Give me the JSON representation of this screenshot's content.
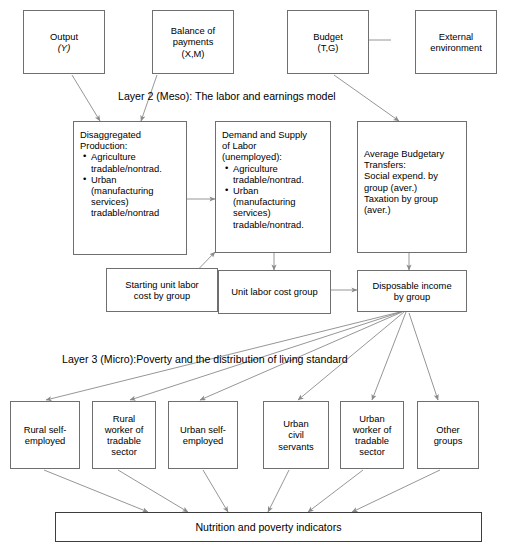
{
  "diagram": {
    "colors": {
      "box_border": "#6f6f6f",
      "arrow": "#8a8a8a",
      "text": "#000000",
      "background": "#ffffff",
      "bottom_bar_border": "#3d3d3d"
    }
  },
  "layer1": {
    "boxes": [
      {
        "id": "output",
        "line1": "Output",
        "line2": "(Y)"
      },
      {
        "id": "bop",
        "line1": "Balance of",
        "line2": "payments",
        "line3": "(X,M)"
      },
      {
        "id": "budget",
        "line1": "Budget",
        "line2": "(T,G)"
      },
      {
        "id": "external",
        "line1": "External",
        "line2": "environment"
      }
    ]
  },
  "layer2": {
    "label": "Layer 2 (Meso): The labor and earnings model",
    "production": {
      "title_line1": "Disaggregated",
      "title_line2": "Production:",
      "bullets": [
        [
          "Agriculture",
          "tradable/nontrad."
        ],
        [
          "Urban",
          "(manufacturing",
          "services)",
          "tradable/nontrad"
        ]
      ]
    },
    "labor": {
      "title_line1": "Demand and Supply",
      "title_line2": "of Labor",
      "title_line3": "(unemployed):",
      "bullets": [
        [
          "Agriculture",
          "tradable/nontrad."
        ],
        [
          "Urban",
          "(manufacturing",
          "services)",
          "tradable/nontrad."
        ]
      ]
    },
    "transfers": {
      "lines": [
        "Average Budgetary",
        "Transfers:",
        "Social expend. by",
        "group (aver.)",
        "Taxation by group",
        "(aver.)"
      ]
    },
    "row2": [
      {
        "id": "starting-unit-labor-cost",
        "line1": "Starting unit labor",
        "line2": "cost by group"
      },
      {
        "id": "unit-labor-cost-group",
        "line1": "Unit labor cost group",
        "line2": ""
      },
      {
        "id": "disposable-income",
        "line1": "Disposable income",
        "line2": "by group"
      }
    ]
  },
  "layer3": {
    "label": "Layer 3 (Micro):Poverty and the distribution of living standard",
    "groups": [
      {
        "id": "rural-self-employed",
        "lines": [
          "Rural self-",
          "employed"
        ]
      },
      {
        "id": "rural-worker-tradable",
        "lines": [
          "Rural",
          "worker of",
          "tradable",
          "sector"
        ]
      },
      {
        "id": "urban-self-employed",
        "lines": [
          "Urban self-",
          "employed"
        ]
      },
      {
        "id": "urban-civil-servants",
        "lines": [
          "Urban",
          "civil",
          "servants"
        ]
      },
      {
        "id": "urban-worker-tradable",
        "lines": [
          "Urban",
          "worker of",
          "tradable",
          "sector"
        ]
      },
      {
        "id": "other-groups",
        "lines": [
          "Other",
          "groups"
        ]
      }
    ]
  },
  "outcome": {
    "label": "Nutrition and poverty indicators"
  }
}
